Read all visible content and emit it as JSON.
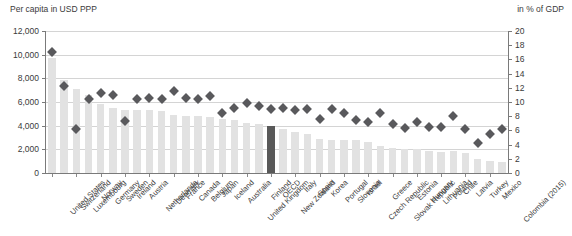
{
  "header": {
    "left_caption": "Per capita in USD PPP",
    "right_caption": "in % of GDP"
  },
  "chart_data": {
    "type": "bar",
    "title": "",
    "xlabel": "",
    "ylabel": "Per capita in USD PPP",
    "y2label": "in % of GDP",
    "ylim": [
      0,
      12000
    ],
    "y2lim": [
      0,
      20
    ],
    "yticks": [
      "0",
      "2,000",
      "4,000",
      "6,000",
      "8,000",
      "10,000",
      "12,000"
    ],
    "ytick_values": [
      0,
      2000,
      4000,
      6000,
      8000,
      10000,
      12000
    ],
    "y2ticks": [
      "0",
      "2",
      "4",
      "6",
      "8",
      "10",
      "12",
      "14",
      "16",
      "18",
      "20"
    ],
    "y2tick_values": [
      0,
      2,
      4,
      6,
      8,
      10,
      12,
      14,
      16,
      18,
      20
    ],
    "grid": true,
    "legend_position": "none",
    "highlight_category": "OECD",
    "highlight_color": "#595959",
    "bar_color": "#e2e2e2",
    "marker_color": "#59595c",
    "categories": [
      "United States",
      "Switzerland",
      "Luxembourg",
      "Norway",
      "Germany",
      "Sweden",
      "Ireland",
      "Austria",
      "Netherlands",
      "Denmark",
      "France",
      "Canada",
      "Belgium",
      "Japan",
      "Iceland",
      "Australia",
      "United Kingdom",
      "Finland",
      "OECD",
      "New Zealand",
      "Italy",
      "Spain",
      "Korea",
      "Portugal",
      "Slovenia",
      "Israel",
      "Czech Republic",
      "Greece",
      "Slovak Republic",
      "Estonia",
      "Hungary",
      "Lithuania",
      "Poland",
      "Chile",
      "Latvia",
      "Turkey",
      "Mexico",
      "Colombia (2015)"
    ],
    "series": [
      {
        "name": "Per capita in USD PPP",
        "axis": "left",
        "type": "bar",
        "values": [
          9700,
          7900,
          7100,
          6600,
          5800,
          5500,
          5300,
          5300,
          5300,
          5200,
          4900,
          4800,
          4800,
          4700,
          4600,
          4500,
          4200,
          4100,
          4000,
          3700,
          3500,
          3300,
          2900,
          2800,
          2800,
          2800,
          2600,
          2300,
          2100,
          2000,
          2000,
          1900,
          1800,
          1900,
          1700,
          1200,
          1000,
          950
        ]
      },
      {
        "name": "in % of GDP",
        "axis": "right",
        "type": "scatter-diamond",
        "values": [
          17.1,
          12.3,
          6.2,
          10.4,
          11.2,
          11.0,
          7.3,
          10.4,
          10.5,
          10.4,
          11.5,
          10.6,
          10.4,
          10.9,
          8.4,
          9.2,
          9.8,
          9.4,
          9.0,
          9.2,
          8.9,
          9.0,
          7.6,
          9.0,
          8.5,
          7.4,
          7.2,
          8.4,
          6.9,
          6.4,
          7.2,
          6.5,
          6.5,
          8.1,
          6.2,
          4.2,
          5.5,
          6.2
        ]
      }
    ]
  }
}
